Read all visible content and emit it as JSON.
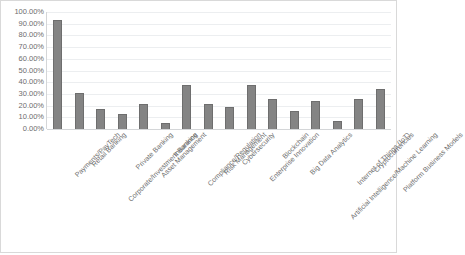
{
  "chart_data": {
    "type": "bar",
    "title": "",
    "xlabel": "",
    "ylabel": "",
    "ylim": [
      0,
      1.0
    ],
    "grid": true,
    "legend": false,
    "y_tick_labels": [
      "100.00%",
      "90.00%",
      "80.00%",
      "70.00%",
      "60.00%",
      "50.00%",
      "40.00%",
      "30.00%",
      "20.00%",
      "10.00%",
      "0.00%"
    ],
    "y_tick_values": [
      1.0,
      0.9,
      0.8,
      0.7,
      0.6,
      0.5,
      0.4,
      0.3,
      0.2,
      0.1,
      0.0
    ],
    "categories": [
      "Payments/PayTech",
      "Retail Banking",
      "Corporate/Investment Banking",
      "Private Banking",
      "Asset Management",
      "Insurance",
      "Compliance/Regulation",
      "Risk Management",
      "Cybersecurity",
      "Enterprise Innovation",
      "Blockchain",
      "Big Data Analytics",
      "Artificial Intelligence/Machine Learning",
      "Internet of Things (IoT)",
      "Cryptocurrencies",
      "Platform Business Models"
    ],
    "values": [
      0.93,
      0.31,
      0.17,
      0.13,
      0.21,
      0.05,
      0.38,
      0.21,
      0.19,
      0.38,
      0.26,
      0.15,
      0.24,
      0.07,
      0.26,
      0.34
    ],
    "value_labels": [
      "93.00%",
      "31.00%",
      "17.00%",
      "13.00%",
      "21.00%",
      "5.00%",
      "38.00%",
      "21.00%",
      "19.00%",
      "38.00%",
      "26.00%",
      "15.00%",
      "24.00%",
      "7.00%",
      "26.00%",
      "34.00%"
    ],
    "colors": {
      "bar_fill": "#848484",
      "bar_edge": "#6e6e6e",
      "gridline": "#eceef0",
      "axis_line": "#d4d6d8",
      "tick_label": "#6d6d6d",
      "frame_border": "#d9d9d9",
      "background": "#ffffff"
    }
  }
}
